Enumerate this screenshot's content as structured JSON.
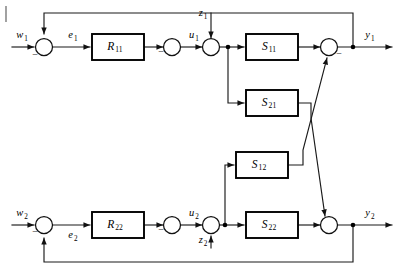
{
  "figure": {
    "type": "control-block-diagram",
    "background_color": "#ffffff",
    "line_color": "#1a1a1a",
    "block_stroke_color": "#000000"
  },
  "blocks": [
    {
      "id": "R11",
      "base": "R",
      "sub": "11",
      "x": 92,
      "y": 34,
      "w": 52,
      "h": 26
    },
    {
      "id": "S11",
      "base": "S",
      "sub": "11",
      "x": 246,
      "y": 34,
      "w": 52,
      "h": 26
    },
    {
      "id": "S21",
      "base": "S",
      "sub": "21",
      "x": 246,
      "y": 90,
      "w": 52,
      "h": 26
    },
    {
      "id": "S12",
      "base": "S",
      "sub": "12",
      "x": 236,
      "y": 152,
      "w": 52,
      "h": 26
    },
    {
      "id": "R22",
      "base": "R",
      "sub": "22",
      "x": 92,
      "y": 212,
      "w": 52,
      "h": 26
    },
    {
      "id": "S22",
      "base": "S",
      "sub": "22",
      "x": 246,
      "y": 212,
      "w": 52,
      "h": 26
    }
  ],
  "summing_junctions": [
    {
      "id": "sum-w1",
      "cx": 44,
      "cy": 47,
      "r": 8.5,
      "sign": "−",
      "sign_dx": -9,
      "sign_dy": 9
    },
    {
      "id": "sum-e1",
      "cx": 172,
      "cy": 47,
      "r": 8.5,
      "sign": "−",
      "sign_dx": -11,
      "sign_dy": 6
    },
    {
      "id": "sum-z1",
      "cx": 211,
      "cy": 47,
      "r": 8.5,
      "sign": "",
      "sign_dx": 0,
      "sign_dy": 0
    },
    {
      "id": "sum-y1",
      "cx": 329,
      "cy": 47,
      "r": 8.5,
      "sign": "−",
      "sign_dx": 10,
      "sign_dy": 8
    },
    {
      "id": "sum-w2",
      "cx": 44,
      "cy": 225,
      "r": 8.5,
      "sign": "−",
      "sign_dx": -9,
      "sign_dy": 8
    },
    {
      "id": "sum-e2",
      "cx": 172,
      "cy": 225,
      "r": 8.5,
      "sign": "−",
      "sign_dx": -11,
      "sign_dy": 6
    },
    {
      "id": "sum-z2",
      "cx": 211,
      "cy": 225,
      "r": 8.5,
      "sign": "",
      "sign_dx": 0,
      "sign_dy": 0
    },
    {
      "id": "sum-y2",
      "cx": 329,
      "cy": 225,
      "r": 8.5,
      "sign": "",
      "sign_dx": 0,
      "sign_dy": 0
    }
  ],
  "signals": [
    {
      "id": "w1",
      "base": "w",
      "sub": "1",
      "x": 22,
      "y": 36
    },
    {
      "id": "e1",
      "base": "e",
      "sub": "1",
      "x": 73,
      "y": 36
    },
    {
      "id": "u1",
      "base": "u",
      "sub": "1",
      "x": 194,
      "y": 36
    },
    {
      "id": "z1",
      "base": "z",
      "sub": "1",
      "x": 203,
      "y": 14
    },
    {
      "id": "y1",
      "base": "y",
      "sub": "1",
      "x": 370,
      "y": 36
    },
    {
      "id": "w2",
      "base": "w",
      "sub": "2",
      "x": 22,
      "y": 214
    },
    {
      "id": "e2",
      "base": "e",
      "sub": "2",
      "x": 73,
      "y": 236
    },
    {
      "id": "u2",
      "base": "u",
      "sub": "2",
      "x": 194,
      "y": 214
    },
    {
      "id": "z2",
      "base": "z",
      "sub": "2",
      "x": 203,
      "y": 241
    },
    {
      "id": "y2",
      "base": "y",
      "sub": "2",
      "x": 370,
      "y": 214
    }
  ],
  "node_dots": [
    {
      "id": "tap-y1",
      "cx": 353,
      "cy": 47
    },
    {
      "id": "tap-u1-branch",
      "cx": 228,
      "cy": 47
    },
    {
      "id": "tap-y2",
      "cx": 353,
      "cy": 225
    },
    {
      "id": "tap-u2-branch",
      "cx": 225,
      "cy": 225
    }
  ],
  "feedback_paths": [
    {
      "id": "feedback-y1-to-w1",
      "description": "y1 tap up to top rail, left to w1 junction, down into junction"
    },
    {
      "id": "feedback-y2-to-w2",
      "description": "y2 tap down to bottom rail, left to w2 junction, up into junction"
    }
  ],
  "cross_couplings": [
    {
      "id": "cross-S21-to-sum-y2",
      "from": "S21",
      "to": "sum-y2",
      "description": "S21 output crosses down-right to lower output junction"
    },
    {
      "id": "cross-S12-to-sum-y1",
      "from": "S12",
      "to": "sum-y1",
      "description": "S12 output crosses up-right to upper output junction"
    }
  ],
  "disturbances": [
    {
      "id": "z1",
      "enters": "sum-z1",
      "direction": "from-top"
    },
    {
      "id": "z2",
      "enters": "sum-z2",
      "direction": "from-bottom"
    }
  ]
}
